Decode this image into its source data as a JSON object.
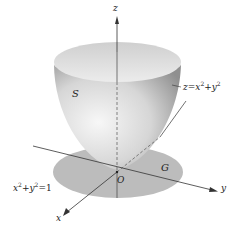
{
  "figure": {
    "axes": {
      "z_label": "z",
      "y_label": "y",
      "x_label": "x",
      "origin_label": "O"
    },
    "surface": {
      "label": "S",
      "equation_lhs": "z",
      "equation_eq": "=",
      "equation_rhs_a": "x",
      "equation_rhs_a_exp": "2",
      "equation_plus": "+",
      "equation_rhs_b": "y",
      "equation_rhs_b_exp": "2"
    },
    "region": {
      "label": "G",
      "boundary_a": "x",
      "boundary_a_exp": "2",
      "boundary_plus": "+",
      "boundary_b": "y",
      "boundary_b_exp": "2",
      "boundary_rhs": "=1"
    },
    "colors": {
      "surface_light": "#f2f2f2",
      "surface_mid": "#c8c8c8",
      "surface_dark": "#9a9a9a",
      "region_fill": "#bdbdbd",
      "axis": "#333333"
    }
  }
}
